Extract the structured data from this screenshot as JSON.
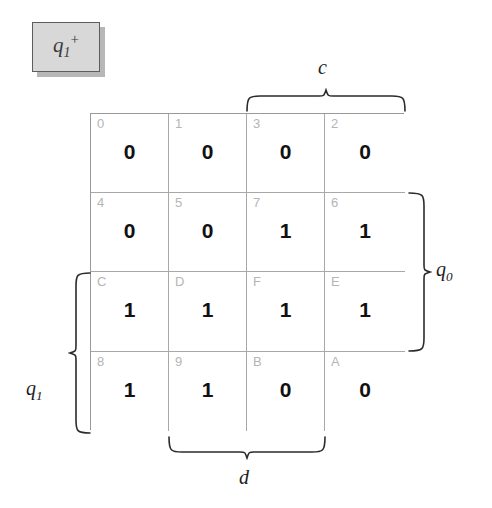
{
  "title": {
    "text": "q1+",
    "base": "q",
    "subscript": "1",
    "superscript": "+"
  },
  "kmap": {
    "rows": 4,
    "cols": 4,
    "cells": [
      [
        {
          "index": "0",
          "value": "0"
        },
        {
          "index": "1",
          "value": "0"
        },
        {
          "index": "3",
          "value": "0"
        },
        {
          "index": "2",
          "value": "0"
        }
      ],
      [
        {
          "index": "4",
          "value": "0"
        },
        {
          "index": "5",
          "value": "0"
        },
        {
          "index": "7",
          "value": "1"
        },
        {
          "index": "6",
          "value": "1"
        }
      ],
      [
        {
          "index": "C",
          "value": "1"
        },
        {
          "index": "D",
          "value": "1"
        },
        {
          "index": "F",
          "value": "1"
        },
        {
          "index": "E",
          "value": "1"
        }
      ],
      [
        {
          "index": "8",
          "value": "1"
        },
        {
          "index": "9",
          "value": "1"
        },
        {
          "index": "B",
          "value": "0"
        },
        {
          "index": "A",
          "value": "0"
        }
      ]
    ]
  },
  "axis_labels": {
    "c": {
      "base": "c",
      "subscript": "",
      "span": "columns 3-4",
      "position": "top"
    },
    "q0": {
      "base": "q",
      "subscript": "0",
      "span": "rows 2-3",
      "position": "right"
    },
    "q1": {
      "base": "q",
      "subscript": "1",
      "span": "rows 3-4",
      "position": "left"
    },
    "d": {
      "base": "d",
      "subscript": "",
      "span": "columns 2-3",
      "position": "bottom"
    }
  },
  "colors": {
    "grid_line": "#a8a8a8",
    "grid_border": "#8a8a8a",
    "index_text": "#b5b5b5",
    "value_text": "#111111",
    "brace": "#2b2b2b",
    "chip_fill": "#d8d8d8",
    "chip_border": "#5d5d5d",
    "background": "#ffffff"
  }
}
